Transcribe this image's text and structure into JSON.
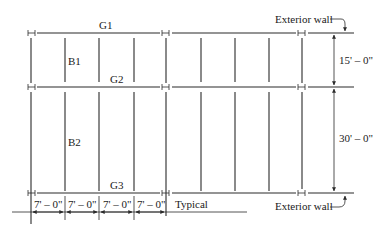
{
  "diagram": {
    "girders": [
      {
        "label": "G1",
        "y": 33
      },
      {
        "label": "G2",
        "y": 87
      },
      {
        "label": "G3",
        "y": 193
      }
    ],
    "beams": [
      {
        "label": "B1"
      },
      {
        "label": "B2"
      }
    ],
    "right_dimensions": [
      {
        "label": "15' – 0\""
      },
      {
        "label": "30' – 0\""
      }
    ],
    "bottom_dimensions": [
      {
        "label": "7' – 0\""
      },
      {
        "label": "7' – 0\""
      },
      {
        "label": "7' – 0\""
      },
      {
        "label": "7' – 0\""
      }
    ],
    "typical_label": "Typical",
    "exterior_wall_top": "Exterior wall",
    "exterior_wall_bottom": "Exterior wall",
    "line_color": "#2a2a2a",
    "background": "#ffffff"
  }
}
